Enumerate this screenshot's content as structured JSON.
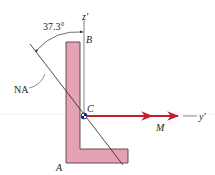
{
  "figure": {
    "type": "unsymmetric bending cross-section",
    "angle_label": "37.3°",
    "neutral_axis_label": "NA",
    "centroid_label": "C",
    "top_point_label": "B",
    "bottom_point_label": "A",
    "moment_label": "M",
    "z_axis_label": "z'",
    "y_axis_label": "y'"
  },
  "colors": {
    "section_fill": "#e3a3b3",
    "section_stroke": "#5a3a42",
    "moment_arrow": "#c21f2a",
    "axis_line": "#8a8aa6",
    "text": "#222222",
    "background": "#ffffff"
  }
}
